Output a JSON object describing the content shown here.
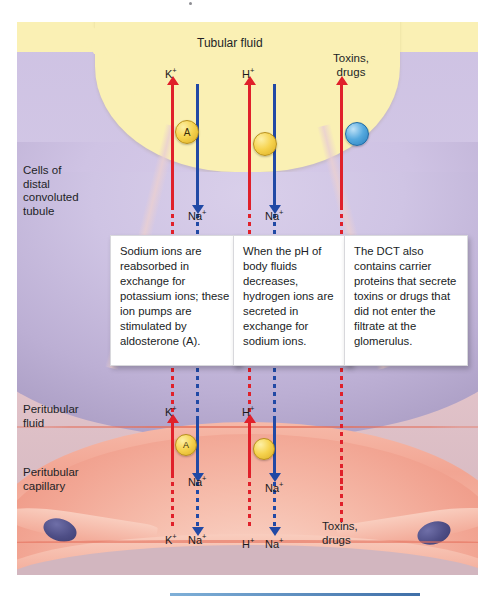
{
  "figure": {
    "regions": {
      "tubular_fluid": "Tubular fluid",
      "cells_dct": "Cells of\ndistal\nconvoluted\ntubule",
      "peritubular_fluid": "Peritubular\nfluid",
      "peritubular_capillary": "Peritubular\ncapillary"
    },
    "colors": {
      "lumen": "#faf0b4",
      "cytoplasm": "#cfc3e4",
      "peritubular_fluid": "#e2c3c9",
      "capillary": "#f2a694",
      "arrow_red": "#e0202a",
      "arrow_blue": "#2149a5",
      "carrier_yellow": "#f6d34f",
      "carrier_blue": "#55a9de",
      "nucleus": "#4e4e86"
    },
    "apical_labels": {
      "potassium": "K",
      "potassium_charge": "+",
      "hydrogen": "H",
      "hydrogen_charge": "+",
      "toxins": "Toxins,\ndrugs"
    },
    "sodium_label": "Na",
    "sodium_charge": "+",
    "carriers": [
      {
        "name": "K-Na exchange pump",
        "type": "yellow",
        "label": "A"
      },
      {
        "name": "H-Na exchange pump",
        "type": "yellow",
        "label": ""
      },
      {
        "name": "toxin carrier protein",
        "type": "blue",
        "label": ""
      }
    ],
    "basal_carriers": [
      {
        "name": "K-Na exchange pump basal",
        "type": "yellow",
        "label": "A"
      },
      {
        "name": "H-Na exchange pump basal",
        "type": "yellow",
        "label": ""
      }
    ],
    "callouts": [
      {
        "id": "aldosterone-callout",
        "text": "Sodium ions are reabsorbed in exchange for potassium ions; these ion pumps are stimulated by aldosterone (A)."
      },
      {
        "id": "ph-callout",
        "text": "When the pH of body fluids decreases, hydrogen ions are secreted in exchange for sodium ions."
      },
      {
        "id": "dct-carrier-callout",
        "text": "The DCT also contains carrier proteins that secrete toxins or drugs that did not enter the filtrate at the glomerulus."
      }
    ],
    "capillary_labels": {
      "potassium": "K",
      "sodium": "Na",
      "hydrogen": "H",
      "charge": "+",
      "toxins": "Toxins,\ndrugs"
    }
  }
}
